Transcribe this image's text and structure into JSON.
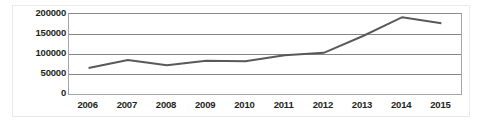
{
  "chart_data": {
    "type": "line",
    "title": "",
    "subtitle": "",
    "xlabel": "",
    "ylabel": "",
    "categories": [
      "2006",
      "2007",
      "2008",
      "2009",
      "2010",
      "2011",
      "2012",
      "2013",
      "2014",
      "2015"
    ],
    "values": [
      65000,
      85000,
      72000,
      83000,
      82000,
      97000,
      103000,
      145000,
      192000,
      177000
    ],
    "series": [
      {
        "name": "",
        "values": [
          65000,
          85000,
          72000,
          83000,
          82000,
          97000,
          103000,
          145000,
          192000,
          177000
        ],
        "color": "#595959"
      }
    ],
    "ylim": [
      0,
      200000
    ],
    "ytick_labels": [
      "200000",
      "150000",
      "100000",
      "50000",
      "0"
    ],
    "ytick_values": [
      200000,
      150000,
      100000,
      50000,
      0
    ],
    "xtick_labels": [
      "2006",
      "2007",
      "2008",
      "2009",
      "2010",
      "2011",
      "2012",
      "2013",
      "2014",
      "2015"
    ],
    "grid": true,
    "grid_orientation": "horizontal",
    "legend": false,
    "legend_position": "none",
    "markers": false,
    "colors": {
      "line": "#595959",
      "gridline": "#868686",
      "axis": "#a6a6a6",
      "text": "#231f20",
      "background": "#ffffff"
    }
  }
}
